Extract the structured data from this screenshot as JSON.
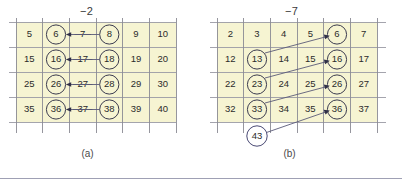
{
  "figure": {
    "title_a_offset": "−2",
    "title_b_offset": "−7",
    "caption_a": "(a)",
    "caption_b": "(b)",
    "cell_fill_color": "#f6f4d2",
    "grid_line_color": "#8b8b93",
    "circle_color": "#3b3b4f",
    "arrow_color": "#5a5a78",
    "rule_color": "#9fa0b4"
  },
  "panel_a": {
    "label": "(a)",
    "offset": "−2",
    "columns": 6,
    "rows": 4,
    "grid": [
      [
        "5",
        "6",
        "7",
        "8",
        "9",
        "10"
      ],
      [
        "15",
        "16",
        "17",
        "18",
        "19",
        "20"
      ],
      [
        "25",
        "26",
        "27",
        "28",
        "29",
        "30"
      ],
      [
        "35",
        "36",
        "37",
        "38",
        "39",
        "40"
      ]
    ],
    "circled": [
      "6",
      "8",
      "16",
      "18",
      "26",
      "28",
      "36",
      "38"
    ],
    "struck_through": [
      "7",
      "17",
      "27",
      "37"
    ],
    "arrows": [
      {
        "from": "8",
        "to": "6",
        "direction": "left"
      },
      {
        "from": "18",
        "to": "16",
        "direction": "left"
      },
      {
        "from": "28",
        "to": "26",
        "direction": "left"
      },
      {
        "from": "38",
        "to": "36",
        "direction": "left"
      }
    ]
  },
  "panel_b": {
    "label": "(b)",
    "offset": "−7",
    "columns": 6,
    "rows": 4,
    "grid": [
      [
        "2",
        "3",
        "4",
        "5",
        "6",
        "7"
      ],
      [
        "12",
        "13",
        "14",
        "15",
        "16",
        "17"
      ],
      [
        "22",
        "23",
        "24",
        "25",
        "26",
        "27"
      ],
      [
        "32",
        "33",
        "34",
        "35",
        "36",
        "37"
      ]
    ],
    "circled": [
      "6",
      "13",
      "16",
      "23",
      "26",
      "33",
      "36"
    ],
    "free_node": "43",
    "arrows": [
      {
        "from": "13",
        "to": "6",
        "direction": "up-right"
      },
      {
        "from": "23",
        "to": "16",
        "direction": "up-right"
      },
      {
        "from": "33",
        "to": "26",
        "direction": "up-right"
      },
      {
        "from": "43",
        "to": "36",
        "direction": "up-right"
      }
    ]
  }
}
